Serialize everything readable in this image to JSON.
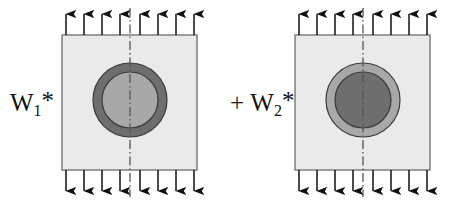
{
  "figure": {
    "type": "mechanics-superposition-diagram",
    "background_color": "#ffffff",
    "width": 454,
    "height": 203
  },
  "panels": [
    {
      "id": "left",
      "label_prefix": "",
      "label_base": "W",
      "label_subscript": "1",
      "label_star": "*",
      "label_full": "W1*",
      "square": {
        "x": 62,
        "y": 35,
        "size": 135,
        "fill_color": "#eaeaea",
        "stroke_color": "#777777"
      },
      "outer_circle": {
        "cx": 130,
        "cy": 100,
        "r": 37,
        "fill_color": "#6e6e6e",
        "stroke_color": "#3a3a3a"
      },
      "inner_circle": {
        "cx": 130,
        "cy": 100,
        "r": 28,
        "fill_color": "#a8a8a8",
        "stroke_color": "#3a3a3a"
      },
      "centerline": {
        "x": 130,
        "y_top": 8,
        "y_bottom": 197,
        "color": "#555555",
        "pattern": "dash-dot"
      },
      "arrows_top": {
        "count": 8,
        "direction": "up",
        "color": "#111111",
        "y_tail": 35,
        "y_tip": 8
      },
      "arrows_bottom": {
        "count": 8,
        "direction": "down",
        "color": "#111111",
        "y_tail": 170,
        "y_tip": 197
      }
    },
    {
      "id": "right",
      "label_prefix": "+",
      "label_base": "W",
      "label_subscript": "2",
      "label_star": "*",
      "label_full": "+ W2*",
      "square": {
        "x": 68,
        "y": 35,
        "size": 135,
        "fill_color": "#eaeaea",
        "stroke_color": "#777777"
      },
      "outer_circle": {
        "cx": 136,
        "cy": 100,
        "r": 37,
        "fill_color": "#a8a8a8",
        "stroke_color": "#3a3a3a"
      },
      "inner_circle": {
        "cx": 136,
        "cy": 100,
        "r": 28,
        "fill_color": "#6e6e6e",
        "stroke_color": "#3a3a3a"
      },
      "centerline": {
        "x": 136,
        "y_top": 8,
        "y_bottom": 197,
        "color": "#555555",
        "pattern": "dash-dot"
      },
      "arrows_top": {
        "count": 8,
        "direction": "up",
        "color": "#111111",
        "y_tail": 35,
        "y_tip": 8
      },
      "arrows_bottom": {
        "count": 8,
        "direction": "down",
        "color": "#111111",
        "y_tail": 170,
        "y_tip": 197
      }
    }
  ]
}
